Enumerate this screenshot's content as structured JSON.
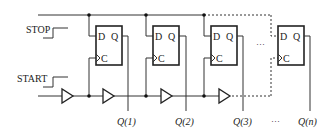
{
  "diagram": {
    "title": "",
    "stop_label": "STOP",
    "start_label": "START",
    "ellipsis": "···",
    "flip_flops": [
      {
        "d_label": "D",
        "q_label": "Q",
        "c_label": "C",
        "output": "Q(1)"
      },
      {
        "d_label": "D",
        "q_label": "Q",
        "c_label": "C",
        "output": "Q(2)"
      },
      {
        "d_label": "D",
        "q_label": "Q",
        "c_label": "C",
        "output": "Q(3)"
      },
      {
        "d_label": "D",
        "q_label": "Q",
        "c_label": "C",
        "output": "Q(n)"
      }
    ],
    "colors": {
      "line": "#333333",
      "background": "#ffffff"
    }
  }
}
